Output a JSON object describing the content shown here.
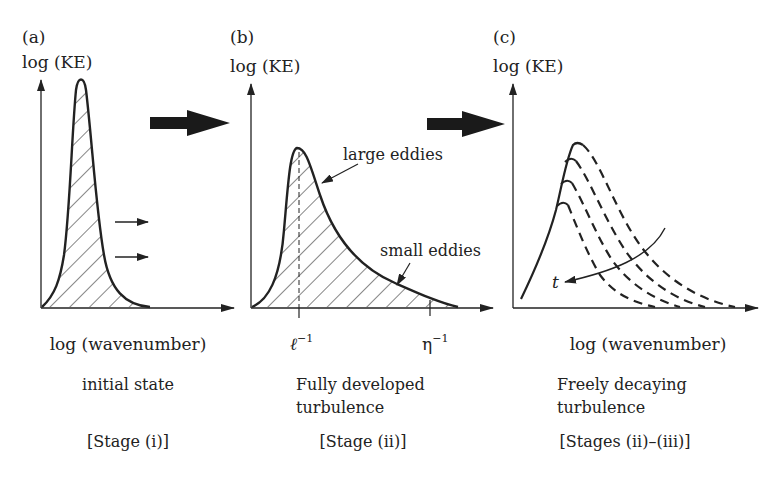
{
  "figure": {
    "colors": {
      "ink": "#222222",
      "background": "#ffffff"
    },
    "panels": [
      {
        "id": "a",
        "tag": "(a)",
        "ylabel": "log (KE)",
        "xlabel": "log (wavenumber)",
        "caption_lines": [
          "initial state"
        ],
        "stage": "[Stage (i)]"
      },
      {
        "id": "b",
        "tag": "(b)",
        "ylabel": "log (KE)",
        "xticks": [
          "ℓ",
          "η"
        ],
        "xtick_superscript": "−1",
        "annotations": [
          "large eddies",
          "small eddies"
        ],
        "caption_lines": [
          "Fully developed",
          "turbulence"
        ],
        "stage": "[Stage (ii)]"
      },
      {
        "id": "c",
        "tag": "(c)",
        "ylabel": "log (KE)",
        "xlabel": "log (wavenumber)",
        "time_label": "t",
        "caption_lines": [
          "Freely decaying",
          "turbulence"
        ],
        "stage": "[Stages (ii)–(iii)]"
      }
    ]
  }
}
